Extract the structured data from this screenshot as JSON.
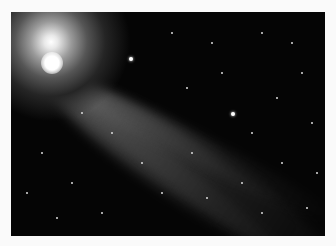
{
  "image": {
    "subject": "comet with long tail against star field",
    "background_color": "#050505",
    "border_color": "#fafafa"
  },
  "stars": [
    [
      118,
      45,
      1
    ],
    [
      200,
      30,
      0
    ],
    [
      250,
      20,
      0
    ],
    [
      290,
      60,
      0
    ],
    [
      300,
      110,
      0
    ],
    [
      270,
      150,
      0
    ],
    [
      220,
      100,
      1
    ],
    [
      180,
      140,
      0
    ],
    [
      150,
      180,
      0
    ],
    [
      90,
      200,
      0
    ],
    [
      60,
      170,
      0
    ],
    [
      30,
      140,
      0
    ],
    [
      250,
      200,
      0
    ],
    [
      295,
      195,
      0
    ],
    [
      210,
      60,
      0
    ],
    [
      160,
      20,
      0
    ],
    [
      100,
      120,
      0
    ],
    [
      70,
      100,
      0
    ],
    [
      240,
      120,
      0
    ],
    [
      280,
      30,
      0
    ],
    [
      130,
      150,
      0
    ],
    [
      195,
      185,
      0
    ],
    [
      230,
      170,
      0
    ],
    [
      45,
      205,
      0
    ],
    [
      15,
      180,
      0
    ],
    [
      265,
      85,
      0
    ],
    [
      305,
      160,
      0
    ],
    [
      175,
      75,
      0
    ]
  ]
}
